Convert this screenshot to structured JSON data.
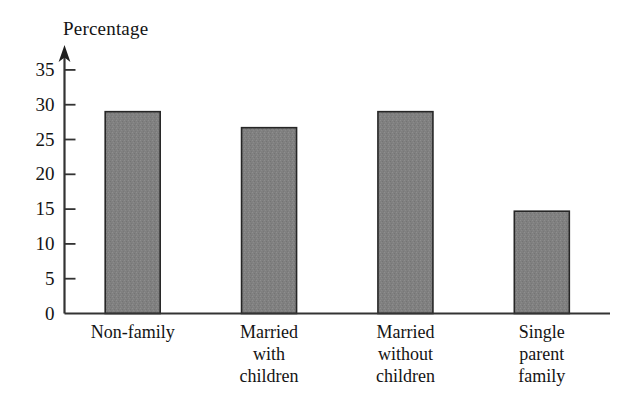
{
  "chart_data": {
    "type": "bar",
    "title": "",
    "ylabel": "Percentage",
    "xlabel": "",
    "categories": [
      "Non-family",
      "Married\nwith\nchildren",
      "Married\nwithout\nchildren",
      "Single\nparent\nfamily"
    ],
    "values": [
      29.0,
      26.7,
      29.0,
      14.7
    ],
    "ylim": [
      0,
      37
    ],
    "yticks": [
      0,
      5,
      10,
      15,
      20,
      25,
      30,
      35
    ],
    "ytick_labels": [
      "0",
      "5",
      "10",
      "15",
      "20",
      "25",
      "30",
      "35"
    ],
    "grid": false,
    "legend": null,
    "bar_color": "#808080",
    "bar_edge_color": "#262626",
    "axis_color": "#333333",
    "background": "#ffffff",
    "axis_arrow": true
  },
  "axis": {
    "y_title": "Percentage"
  }
}
